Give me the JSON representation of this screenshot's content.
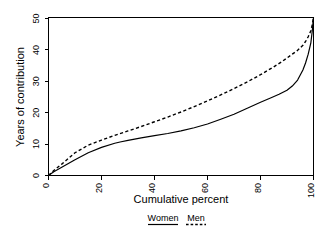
{
  "chart_data": {
    "type": "line",
    "title": "",
    "xlabel": "Cumulative percent",
    "ylabel": "Years of contribution",
    "xlim": [
      0,
      100
    ],
    "ylim": [
      0,
      50
    ],
    "xticks": [
      "0",
      "20",
      "40",
      "60",
      "80",
      "100"
    ],
    "yticks": [
      "0",
      "10",
      "20",
      "30",
      "40",
      "50"
    ],
    "xtick_values": [
      0,
      20,
      40,
      60,
      80,
      100
    ],
    "ytick_values": [
      0,
      10,
      20,
      30,
      40,
      50
    ],
    "grid": false,
    "legend_position": "below-axes",
    "tick_label_rotation": 90,
    "series": [
      {
        "name": "Women",
        "style": "solid",
        "color": "#000000",
        "x": [
          0,
          2,
          5,
          10,
          15,
          20,
          25,
          27,
          30,
          35,
          40,
          45,
          50,
          55,
          60,
          65,
          70,
          75,
          80,
          84,
          87,
          90,
          92,
          94,
          96,
          97,
          98,
          99,
          99.5,
          100
        ],
        "values": [
          0,
          1.2,
          2.6,
          5.0,
          7.2,
          8.9,
          10.2,
          10.6,
          11.1,
          11.9,
          12.6,
          13.3,
          14.1,
          15.1,
          16.3,
          17.8,
          19.4,
          21.3,
          23.2,
          24.6,
          25.7,
          27.0,
          28.3,
          30.2,
          33.4,
          35.6,
          38.4,
          42.0,
          45.5,
          50.0
        ]
      },
      {
        "name": "Men",
        "style": "dashed",
        "color": "#000000",
        "x": [
          0,
          2,
          5,
          10,
          15,
          20,
          25,
          30,
          35,
          40,
          45,
          50,
          55,
          60,
          65,
          70,
          75,
          80,
          85,
          88,
          90,
          92,
          94,
          96,
          97,
          98,
          99,
          99.5,
          100
        ],
        "values": [
          0,
          1.6,
          3.6,
          7.2,
          9.6,
          11.2,
          12.7,
          14.1,
          15.5,
          17.0,
          18.5,
          20.1,
          21.8,
          23.6,
          25.5,
          27.5,
          29.6,
          31.9,
          34.4,
          36.0,
          37.2,
          38.4,
          39.6,
          41.2,
          42.4,
          43.9,
          45.8,
          47.6,
          50.0
        ]
      }
    ],
    "legend": [
      {
        "label": "Women",
        "style": "solid"
      },
      {
        "label": "Men",
        "style": "dashed"
      }
    ]
  }
}
